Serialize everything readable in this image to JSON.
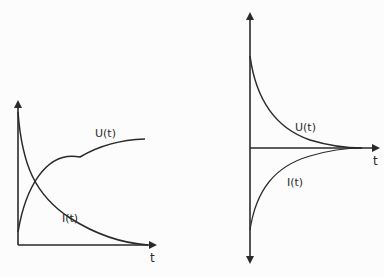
{
  "figure": {
    "left_graph": {
      "title": "Charging",
      "x_axis_label": "t",
      "curves": [
        {
          "name": "U(t)",
          "label": "U(t)",
          "shape": "rising-exponential"
        },
        {
          "name": "I(t)",
          "label": "I(t)",
          "shape": "decaying-exponential"
        }
      ]
    },
    "right_graph": {
      "title": "Discharging",
      "x_axis_label": "t",
      "curves": [
        {
          "name": "U(t)",
          "label": "U(t)",
          "shape": "positive-decay"
        },
        {
          "name": "I(t)",
          "label": "I(t)",
          "shape": "negative-decay"
        }
      ]
    },
    "line_color": "#2a2a2a"
  }
}
